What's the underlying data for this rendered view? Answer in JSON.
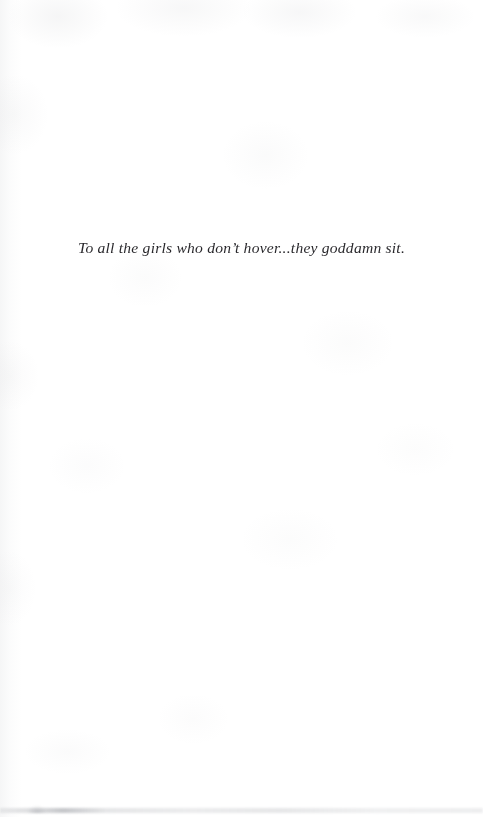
{
  "page": {
    "kind": "book-dedication-page",
    "background_color": "#ffffff",
    "width": 483,
    "height": 817
  },
  "dedication": {
    "text": "To all the girls who don’t hover...they goddamn sit.",
    "alignment": "center",
    "style": "italic-serif",
    "text_color": "#17161a"
  },
  "artifacts": {
    "paper_texture_label": "scanned-paper-mottling",
    "gutter_label": "left-edge-binding-shadow",
    "bottom_edge_label": "bottom-scan-edge-line"
  }
}
